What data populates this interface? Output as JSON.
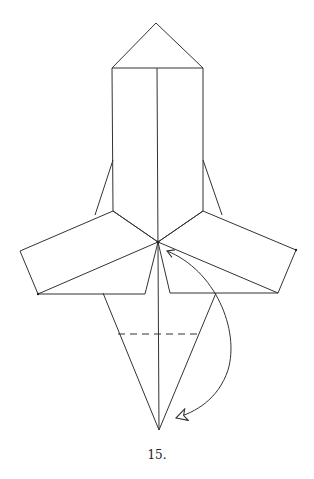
{
  "diagram": {
    "type": "origami-fold-step",
    "step_label": "15.",
    "stroke_color": "#333333",
    "background": "#ffffff",
    "elements": {
      "hood_apex": [
        156,
        23
      ],
      "body_rect": {
        "top": 68,
        "left": 112,
        "right": 203,
        "bottom": 211
      },
      "center_point": [
        158,
        242
      ],
      "left_arm": [
        [
          113,
          211
        ],
        [
          20,
          251
        ],
        [
          38,
          294
        ],
        [
          158,
          242
        ]
      ],
      "right_arm": [
        [
          203,
          211
        ],
        [
          296,
          250
        ],
        [
          278,
          293
        ],
        [
          158,
          242
        ]
      ],
      "kite": [
        [
          103,
          293
        ],
        [
          159,
          430
        ],
        [
          216,
          293
        ]
      ],
      "valley_fold_dashed_y": 334,
      "fold_arrow": "curved arrow from bottom point up to center"
    }
  }
}
